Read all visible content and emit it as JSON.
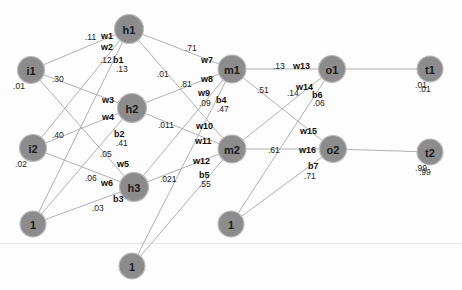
{
  "diagram": {
    "width": 462,
    "height": 290,
    "colors": {
      "node_fill": "#8c8c8c",
      "node_stroke": "#bdbdbd",
      "edge": "#a8a8a8",
      "text": "#111111",
      "background": "#fdfdfd"
    }
  },
  "nodes": [
    {
      "id": "i1",
      "label": "i1",
      "x": 31,
      "y": 70,
      "r": 13.5,
      "value": ".01",
      "value_dx": -12,
      "value_dy": 16
    },
    {
      "id": "i2",
      "label": "i2",
      "x": 33,
      "y": 148,
      "r": 13.5,
      "value": ".02",
      "value_dx": -12,
      "value_dy": 16
    },
    {
      "id": "bias1",
      "label": "1",
      "x": 33,
      "y": 224,
      "r": 13.0,
      "value": "",
      "value_dx": 0,
      "value_dy": 0
    },
    {
      "id": "h1",
      "label": "h1",
      "x": 129,
      "y": 29,
      "r": 14.5,
      "value": "",
      "value_dx": 0,
      "value_dy": 0
    },
    {
      "id": "h2",
      "label": "h2",
      "x": 132,
      "y": 108,
      "r": 14.5,
      "value": "",
      "value_dx": 0,
      "value_dy": 0
    },
    {
      "id": "h3",
      "label": "h3",
      "x": 134,
      "y": 187,
      "r": 14.5,
      "value": "",
      "value_dx": 0,
      "value_dy": 0
    },
    {
      "id": "bias3",
      "label": "1",
      "x": 132,
      "y": 266,
      "r": 13.0,
      "value": "",
      "value_dx": 0,
      "value_dy": 0
    },
    {
      "id": "m1",
      "label": "m1",
      "x": 232,
      "y": 69,
      "r": 14.0,
      "value": "",
      "value_dx": 0,
      "value_dy": 0
    },
    {
      "id": "m2",
      "label": "m2",
      "x": 232,
      "y": 149,
      "r": 14.0,
      "value": "",
      "value_dx": 0,
      "value_dy": 0
    },
    {
      "id": "bias2",
      "label": "1",
      "x": 231,
      "y": 224,
      "r": 13.0,
      "value": "",
      "value_dx": 0,
      "value_dy": 0
    },
    {
      "id": "o1",
      "label": "o1",
      "x": 332,
      "y": 69,
      "r": 13.5,
      "value": "",
      "value_dx": 0,
      "value_dy": 0
    },
    {
      "id": "o2",
      "label": "o2",
      "x": 333,
      "y": 149,
      "r": 13.5,
      "value": "",
      "value_dx": 0,
      "value_dy": 0
    },
    {
      "id": "t1",
      "label": "t1",
      "x": 430,
      "y": 69,
      "r": 13.0,
      "value": ".01",
      "value_dx": -9,
      "value_dy": 16
    },
    {
      "id": "t2",
      "label": "t2",
      "x": 430,
      "y": 152,
      "r": 13.0,
      "value": ".99",
      "value_dx": -9,
      "value_dy": 16
    }
  ],
  "edges": [
    {
      "from": "i1",
      "to": "h1"
    },
    {
      "from": "i1",
      "to": "h2"
    },
    {
      "from": "i1",
      "to": "h3"
    },
    {
      "from": "i2",
      "to": "h1"
    },
    {
      "from": "i2",
      "to": "h2"
    },
    {
      "from": "i2",
      "to": "h3"
    },
    {
      "from": "bias1",
      "to": "h1"
    },
    {
      "from": "bias1",
      "to": "h2"
    },
    {
      "from": "bias1",
      "to": "h3"
    },
    {
      "from": "h1",
      "to": "m1"
    },
    {
      "from": "h1",
      "to": "m2"
    },
    {
      "from": "h2",
      "to": "m1"
    },
    {
      "from": "h2",
      "to": "m2"
    },
    {
      "from": "h3",
      "to": "m1"
    },
    {
      "from": "h3",
      "to": "m2"
    },
    {
      "from": "bias3",
      "to": "m1"
    },
    {
      "from": "bias3",
      "to": "m2"
    },
    {
      "from": "m1",
      "to": "o1"
    },
    {
      "from": "m1",
      "to": "o2"
    },
    {
      "from": "m2",
      "to": "o1"
    },
    {
      "from": "m2",
      "to": "o2"
    },
    {
      "from": "bias2",
      "to": "o1"
    },
    {
      "from": "bias2",
      "to": "o2"
    },
    {
      "from": "o1",
      "to": "t1"
    },
    {
      "from": "o2",
      "to": "t2"
    }
  ],
  "weight_labels": [
    {
      "name": "w1",
      "text": "w1",
      "x": 101,
      "y": 32
    },
    {
      "name": "w2",
      "text": "w2",
      "x": 101,
      "y": 43
    },
    {
      "name": "b1",
      "text": "b1",
      "x": 113,
      "y": 56
    },
    {
      "name": "w3",
      "text": "w3",
      "x": 102,
      "y": 96
    },
    {
      "name": "w4",
      "text": "w4",
      "x": 102,
      "y": 113
    },
    {
      "name": "b2",
      "text": "b2",
      "x": 114,
      "y": 130
    },
    {
      "name": "w5",
      "text": "w5",
      "x": 117,
      "y": 160
    },
    {
      "name": "w6",
      "text": "w6",
      "x": 101,
      "y": 179
    },
    {
      "name": "b3",
      "text": "b3",
      "x": 113,
      "y": 195
    },
    {
      "name": "w7",
      "text": "w7",
      "x": 201,
      "y": 56
    },
    {
      "name": "w8",
      "text": "w8",
      "x": 201,
      "y": 75
    },
    {
      "name": "w9",
      "text": "w9",
      "x": 198,
      "y": 89
    },
    {
      "name": "b4",
      "text": "b4",
      "x": 216,
      "y": 96
    },
    {
      "name": "w10",
      "text": "w10",
      "x": 196,
      "y": 122
    },
    {
      "name": "w11",
      "text": "w11",
      "x": 195,
      "y": 137
    },
    {
      "name": "w12",
      "text": "w12",
      "x": 193,
      "y": 157
    },
    {
      "name": "b5",
      "text": "b5",
      "x": 199,
      "y": 171
    },
    {
      "name": "w13",
      "text": "w13",
      "x": 293,
      "y": 62
    },
    {
      "name": "w14",
      "text": "w14",
      "x": 296,
      "y": 83
    },
    {
      "name": "b6",
      "text": "b6",
      "x": 312,
      "y": 91
    },
    {
      "name": "w15",
      "text": "w15",
      "x": 300,
      "y": 127
    },
    {
      "name": "w16",
      "text": "w16",
      "x": 299,
      "y": 146
    },
    {
      "name": "b7",
      "text": "b7",
      "x": 308,
      "y": 162
    }
  ],
  "value_labels": [
    {
      "name": "w1-value",
      "text": ".11",
      "x": 85,
      "y": 33
    },
    {
      "name": "w2-value",
      "text": ".12",
      "x": 100,
      "y": 56
    },
    {
      "name": "b1-value",
      "text": ".13",
      "x": 116,
      "y": 65
    },
    {
      "name": "i1-w3-value",
      "text": ".30",
      "x": 52,
      "y": 75
    },
    {
      "name": "w3-value",
      "text": ".01",
      "x": 157,
      "y": 70
    },
    {
      "name": "w4-value",
      "text": ".81",
      "x": 180,
      "y": 80
    },
    {
      "name": "b2-value",
      "text": ".41",
      "x": 116,
      "y": 139
    },
    {
      "name": "i2-value-b",
      "text": ".40",
      "x": 52,
      "y": 131
    },
    {
      "name": "w5-value",
      "text": ".05",
      "x": 100,
      "y": 150
    },
    {
      "name": "w6-value",
      "text": ".06",
      "x": 85,
      "y": 174
    },
    {
      "name": "b3-value",
      "text": ".03",
      "x": 92,
      "y": 204
    },
    {
      "name": "w7-value",
      "text": ".71",
      "x": 185,
      "y": 44
    },
    {
      "name": "w9-value",
      "text": ".09",
      "x": 199,
      "y": 99
    },
    {
      "name": "b4-value",
      "text": ".47",
      "x": 217,
      "y": 105
    },
    {
      "name": "h2-m2-value",
      "text": ".011",
      "x": 158,
      "y": 121
    },
    {
      "name": "h3-m1-value",
      "text": ".021",
      "x": 160,
      "y": 175
    },
    {
      "name": "b5-value",
      "text": ".55",
      "x": 199,
      "y": 180
    },
    {
      "name": "m1-o1-value",
      "text": ".13",
      "x": 273,
      "y": 62
    },
    {
      "name": "m1-o2-value",
      "text": ".51",
      "x": 257,
      "y": 86
    },
    {
      "name": "w14-value",
      "text": ".14",
      "x": 287,
      "y": 89
    },
    {
      "name": "b6-value",
      "text": ".06",
      "x": 313,
      "y": 99
    },
    {
      "name": "m2-o2-value",
      "text": ".61",
      "x": 268,
      "y": 146
    },
    {
      "name": "b7-value",
      "text": ".71",
      "x": 304,
      "y": 172
    },
    {
      "name": "t1-value-dup",
      "text": ".01",
      "x": 419,
      "y": 85
    },
    {
      "name": "t2-value-dup",
      "text": ".99",
      "x": 419,
      "y": 168
    }
  ]
}
